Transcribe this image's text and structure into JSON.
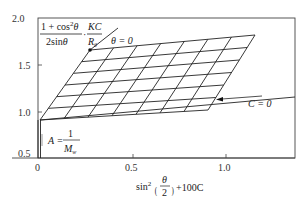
{
  "chart_data": {
    "type": "line",
    "xlabel": "sin²(θ/2) + 100C",
    "ylabel": "(1 + cos²θ)/(2 sinθ) · KC/R_θ",
    "xlim": [
      0,
      1.3
    ],
    "ylim": [
      0.5,
      2.0
    ],
    "x_ticks": [
      "0",
      "0.5",
      "1.0"
    ],
    "y_ticks": [
      "0.5",
      "1.0",
      "1.5",
      "2.0"
    ],
    "grid": false,
    "annotations": [
      {
        "text": "θ = 0",
        "points_to": "extrapolated zero-angle line"
      },
      {
        "text": "C = 0",
        "points_to": "extrapolated zero-concentration line"
      },
      {
        "text": "A = 1/M_w",
        "points_to": "intercept at x = 0"
      }
    ],
    "series": [
      {
        "name": "constant concentration lines",
        "count": 7,
        "slope_sign": "positive, shallow"
      },
      {
        "name": "constant angle lines",
        "count": 8,
        "slope_sign": "positive, steep"
      }
    ],
    "corners": {
      "theta0_C_max": [
        0.28,
        1.66
      ],
      "theta0_C0": [
        0.01,
        0.92
      ],
      "theta_max_C_max": [
        1.14,
        1.82
      ],
      "theta_max_C0": [
        0.89,
        1.05
      ]
    },
    "intercept_A": 0.92
  },
  "labels": {
    "ylabel_num": "1 + cos",
    "ylabel_sup": "2",
    "ylabel_theta": "θ",
    "ylabel_den": "2sin",
    "ylabel_frac2_num": "KC",
    "ylabel_frac2_den": "R",
    "ylabel_frac2_sub": "θ",
    "theta0": "θ = 0",
    "c0": "C = 0",
    "a_left": "A =",
    "a_num": "1",
    "a_den": "M",
    "a_sub": "w",
    "xlabel_sin": "sin",
    "xlabel_sup": "2",
    "xlabel_theta": "θ",
    "xlabel_two": "2",
    "xlabel_tail": "+100C"
  },
  "ticks": {
    "y": [
      "2.0",
      "1.5",
      "1.0",
      "0.5"
    ],
    "x": [
      "0",
      "0.5",
      "1.0"
    ]
  }
}
